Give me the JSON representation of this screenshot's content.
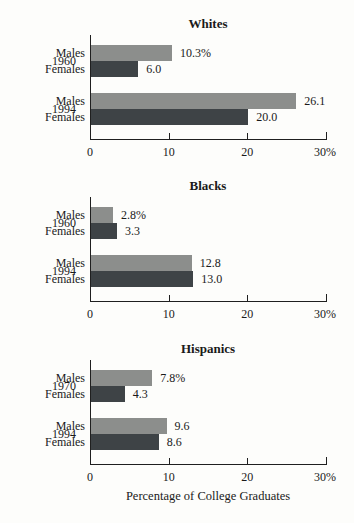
{
  "figure": {
    "xlabel": "Percentage of College Graduates",
    "colors": {
      "males_bar": "#8c8e8c",
      "females_bar": "#3e4346",
      "axis": "#1f1f1f"
    }
  },
  "chart_data": [
    {
      "type": "bar",
      "orientation": "horizontal",
      "title": "Whites",
      "xlim": [
        0,
        30
      ],
      "xticks": [
        "0",
        "10",
        "20",
        "30%"
      ],
      "grid": false,
      "legend": "none",
      "groups": [
        {
          "year": "1960",
          "bars": [
            {
              "label": "Males",
              "value": 10.3,
              "display": "10.3%"
            },
            {
              "label": "Females",
              "value": 6.0,
              "display": "6.0"
            }
          ]
        },
        {
          "year": "1994",
          "bars": [
            {
              "label": "Males",
              "value": 26.1,
              "display": "26.1"
            },
            {
              "label": "Females",
              "value": 20.0,
              "display": "20.0"
            }
          ]
        }
      ]
    },
    {
      "type": "bar",
      "orientation": "horizontal",
      "title": "Blacks",
      "xlim": [
        0,
        30
      ],
      "xticks": [
        "0",
        "10",
        "20",
        "30%"
      ],
      "grid": false,
      "legend": "none",
      "groups": [
        {
          "year": "1960",
          "bars": [
            {
              "label": "Males",
              "value": 2.8,
              "display": "2.8%"
            },
            {
              "label": "Females",
              "value": 3.3,
              "display": "3.3"
            }
          ]
        },
        {
          "year": "1994",
          "bars": [
            {
              "label": "Males",
              "value": 12.8,
              "display": "12.8"
            },
            {
              "label": "Females",
              "value": 13.0,
              "display": "13.0"
            }
          ]
        }
      ]
    },
    {
      "type": "bar",
      "orientation": "horizontal",
      "title": "Hispanics",
      "xlim": [
        0,
        30
      ],
      "xticks": [
        "0",
        "10",
        "20",
        "30%"
      ],
      "grid": false,
      "legend": "none",
      "groups": [
        {
          "year": "1970",
          "bars": [
            {
              "label": "Males",
              "value": 7.8,
              "display": "7.8%"
            },
            {
              "label": "Females",
              "value": 4.3,
              "display": "4.3"
            }
          ]
        },
        {
          "year": "1994",
          "bars": [
            {
              "label": "Males",
              "value": 9.6,
              "display": "9.6"
            },
            {
              "label": "Females",
              "value": 8.6,
              "display": "8.6"
            }
          ]
        }
      ]
    }
  ]
}
